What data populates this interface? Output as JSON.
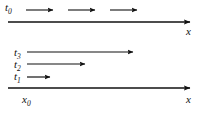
{
  "figure": {
    "width": 203,
    "height": 113,
    "background_color": "#ffffff",
    "stroke_color": "#111111"
  },
  "labels": {
    "t0": {
      "symbol": "t",
      "subscript": "0",
      "text": "t0"
    },
    "t1": {
      "symbol": "t",
      "subscript": "1",
      "text": "t1"
    },
    "t2": {
      "symbol": "t",
      "subscript": "2",
      "text": "t2"
    },
    "t3": {
      "symbol": "t",
      "subscript": "3",
      "text": "t3"
    },
    "x0": {
      "symbol": "x",
      "subscript": "0",
      "text": "x0"
    },
    "x_top": {
      "symbol": "x",
      "subscript": "",
      "text": "x"
    },
    "x_bottom": {
      "symbol": "x",
      "subscript": "",
      "text": "x"
    }
  },
  "diagram_data": {
    "type": "vector-diagram",
    "panels": [
      {
        "name": "top-panel",
        "axis": {
          "name": "x-axis-top",
          "x_start": 8,
          "x_end": 196,
          "y": 22,
          "arrowhead": "right",
          "label": "x"
        },
        "arrows": [
          {
            "name": "top-arrow-1",
            "x_start": 26,
            "x_end": 56,
            "y": 10,
            "length": 30
          },
          {
            "name": "top-arrow-2",
            "x_start": 68,
            "x_end": 98,
            "y": 10,
            "length": 30
          },
          {
            "name": "top-arrow-3",
            "x_start": 110,
            "x_end": 140,
            "y": 10,
            "length": 30
          }
        ],
        "time_label": "t0",
        "note": "Three equal displacement arrows at instant t0"
      },
      {
        "name": "bottom-panel",
        "axis": {
          "name": "x-axis-bottom",
          "x_start": 8,
          "x_end": 196,
          "y": 88,
          "arrowhead": "right",
          "label": "x",
          "origin_label": "x0"
        },
        "arrows": [
          {
            "name": "t3-arrow",
            "x_start": 27,
            "x_end": 136,
            "y": 52,
            "length": 109,
            "time_label": "t3"
          },
          {
            "name": "t2-arrow",
            "x_start": 27,
            "x_end": 88,
            "y": 64,
            "length": 61,
            "time_label": "t2"
          },
          {
            "name": "t1-arrow",
            "x_start": 27,
            "x_end": 53,
            "y": 77,
            "length": 26,
            "time_label": "t1"
          }
        ],
        "note": "Arrows of increasing length for t1 < t2 < t3 starting from x0"
      }
    ]
  }
}
